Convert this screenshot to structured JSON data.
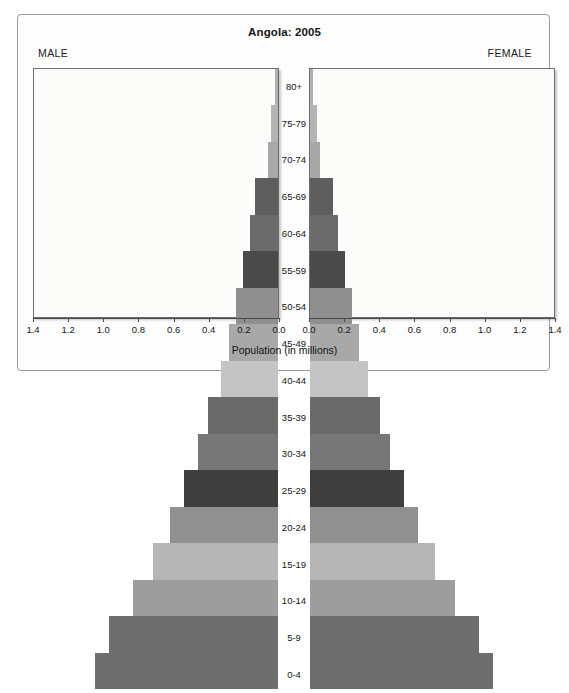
{
  "chart": {
    "title": "Angola: 2005",
    "male_label": "MALE",
    "female_label": "FEMALE",
    "xlabel": "Population (in millions)"
  },
  "chart_data": {
    "type": "bar",
    "subtype": "population-pyramid",
    "title": "Angola: 2005",
    "xlabel": "Population (in millions)",
    "ylabel": "",
    "grid": false,
    "legend": "none",
    "orientation": "horizontal",
    "axis_direction": "diverging",
    "xlim": [
      0,
      1.4
    ],
    "xticks": [
      0.0,
      0.2,
      0.4,
      0.6,
      0.8,
      1.0,
      1.2,
      1.4
    ],
    "xtick_labels_male": [
      "1.4",
      "1.2",
      "1.0",
      "0.8",
      "0.6",
      "0.4",
      "0.2",
      "0.0"
    ],
    "xtick_labels_female": [
      "0.0",
      "0.2",
      "0.4",
      "0.6",
      "0.8",
      "1.0",
      "1.2",
      "1.4"
    ],
    "categories": [
      "80+",
      "75-79",
      "70-74",
      "65-69",
      "60-64",
      "55-59",
      "50-54",
      "45-49",
      "40-44",
      "35-39",
      "30-34",
      "25-29",
      "20-24",
      "15-19",
      "10-14",
      "5-9",
      "0-4"
    ],
    "series": [
      {
        "name": "MALE",
        "side": "left",
        "values": [
          0.02,
          0.04,
          0.06,
          0.13,
          0.16,
          0.2,
          0.24,
          0.28,
          0.33,
          0.4,
          0.46,
          0.54,
          0.62,
          0.72,
          0.83,
          0.97,
          1.05
        ]
      },
      {
        "name": "FEMALE",
        "side": "right",
        "values": [
          0.02,
          0.04,
          0.06,
          0.13,
          0.16,
          0.2,
          0.24,
          0.28,
          0.33,
          0.4,
          0.46,
          0.54,
          0.62,
          0.72,
          0.83,
          0.97,
          1.05
        ]
      }
    ],
    "bar_colors": [
      "#b0b0b0",
      "#b4b4b4",
      "#a8a8a8",
      "#5e5e5e",
      "#6b6b6b",
      "#4a4a4a",
      "#8f8f8f",
      "#a8a8a8",
      "#c4c4c4",
      "#6a6a6a",
      "#777777",
      "#3f3f3f",
      "#909090",
      "#b6b6b6",
      "#9d9d9d",
      "#6e6e6e",
      "#6e6e6e"
    ],
    "panel_background": "#fcfcfb",
    "frame_color": "#9a9a9a"
  },
  "age_rows": [
    {
      "label": "80+",
      "male": 0.02,
      "female": 0.02,
      "color": "#b0b0b0"
    },
    {
      "label": "75-79",
      "male": 0.04,
      "female": 0.04,
      "color": "#b4b4b4"
    },
    {
      "label": "70-74",
      "male": 0.06,
      "female": 0.06,
      "color": "#a8a8a8"
    },
    {
      "label": "65-69",
      "male": 0.13,
      "female": 0.13,
      "color": "#5e5e5e"
    },
    {
      "label": "60-64",
      "male": 0.16,
      "female": 0.16,
      "color": "#6b6b6b"
    },
    {
      "label": "55-59",
      "male": 0.2,
      "female": 0.2,
      "color": "#4a4a4a"
    },
    {
      "label": "50-54",
      "male": 0.24,
      "female": 0.24,
      "color": "#8f8f8f"
    },
    {
      "label": "45-49",
      "male": 0.28,
      "female": 0.28,
      "color": "#a8a8a8"
    },
    {
      "label": "40-44",
      "male": 0.33,
      "female": 0.33,
      "color": "#c4c4c4"
    },
    {
      "label": "35-39",
      "male": 0.4,
      "female": 0.4,
      "color": "#6a6a6a"
    },
    {
      "label": "30-34",
      "male": 0.46,
      "female": 0.46,
      "color": "#777777"
    },
    {
      "label": "25-29",
      "male": 0.54,
      "female": 0.54,
      "color": "#3f3f3f"
    },
    {
      "label": "20-24",
      "male": 0.62,
      "female": 0.62,
      "color": "#909090"
    },
    {
      "label": "15-19",
      "male": 0.72,
      "female": 0.72,
      "color": "#b6b6b6"
    },
    {
      "label": "10-14",
      "male": 0.83,
      "female": 0.83,
      "color": "#9d9d9d"
    },
    {
      "label": "5-9",
      "male": 0.97,
      "female": 0.97,
      "color": "#6e6e6e"
    },
    {
      "label": "0-4",
      "male": 1.05,
      "female": 1.05,
      "color": "#6e6e6e"
    }
  ]
}
